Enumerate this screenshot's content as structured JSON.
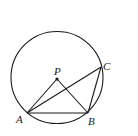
{
  "diagram": {
    "type": "geometry",
    "colors": {
      "stroke": "#1a1a1a",
      "background": "#ffffff"
    },
    "circle": {
      "cx": 57,
      "cy": 77.5,
      "r": 46
    },
    "points": {
      "P": {
        "label": "P",
        "x": 57,
        "y": 79
      },
      "A": {
        "label": "A",
        "x": 27,
        "y": 113
      },
      "B": {
        "label": "B",
        "x": 88,
        "y": 113
      },
      "C": {
        "label": "C",
        "x": 101,
        "y": 67
      }
    },
    "segments": [
      [
        "P",
        "A"
      ],
      [
        "P",
        "B"
      ],
      [
        "A",
        "B"
      ],
      [
        "A",
        "C"
      ],
      [
        "B",
        "C"
      ]
    ]
  }
}
